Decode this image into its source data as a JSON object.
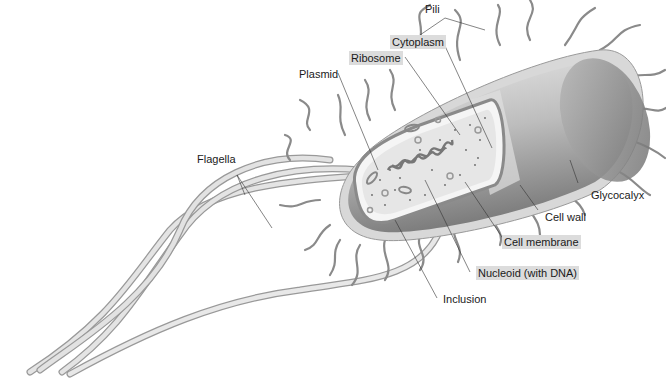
{
  "labels": {
    "pili": "Pili",
    "cytoplasm": "Cytoplasm",
    "ribosome": "Ribosome",
    "plasmid": "Plasmid",
    "flagella": "Flagella",
    "glycocalyx": "Glycocalyx",
    "cell_wall": "Cell wall",
    "cell_membrane": "Cell membrane",
    "nucleoid": "Nucleoid (with DNA)",
    "inclusion": "Inclusion"
  },
  "colors": {
    "label_highlight": "#dcdcdc",
    "structure_gray": "#8a8a8a",
    "capsule_light": "#d6d6d6",
    "cytoplasm_fill": "#e6e6e6",
    "leader_line": "#333333"
  }
}
